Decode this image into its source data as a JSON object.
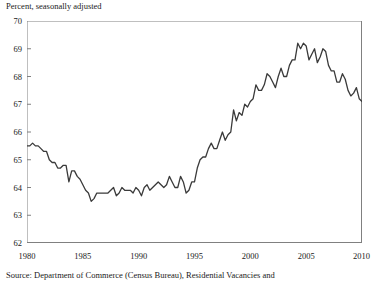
{
  "figure": {
    "subtitle": "Percent, seasonally adjusted",
    "source": "Source:  Department of Commerce (Census Bureau), Residential Vacancies and"
  },
  "colors": {
    "line": "#3a3a3a",
    "axis": "#808080",
    "text": "#1a1a1a",
    "background": "#ffffff"
  },
  "chart_data": {
    "type": "line",
    "title": "",
    "subtitle": "Percent, seasonally adjusted",
    "xlabel": "",
    "ylabel": "",
    "ylim": [
      62,
      70
    ],
    "xlim": [
      1980,
      2010
    ],
    "ytick_labels": [
      "62",
      "63",
      "64",
      "65",
      "66",
      "67",
      "68",
      "69",
      "70"
    ],
    "yticks": [
      62,
      63,
      64,
      65,
      66,
      67,
      68,
      69,
      70
    ],
    "xtick_labels": [
      "1980",
      "1985",
      "1990",
      "1995",
      "2000",
      "2005",
      "2010"
    ],
    "xticks": [
      1980,
      1985,
      1990,
      1995,
      2000,
      2005,
      2010
    ],
    "grid": false,
    "legend": false,
    "series": [
      {
        "name": "Homeownership rate",
        "x": [
          1980.0,
          1980.25,
          1980.5,
          1980.75,
          1981.0,
          1981.25,
          1981.5,
          1981.75,
          1982.0,
          1982.25,
          1982.5,
          1982.75,
          1983.0,
          1983.25,
          1983.5,
          1983.75,
          1984.0,
          1984.25,
          1984.5,
          1984.75,
          1985.0,
          1985.25,
          1985.5,
          1985.75,
          1986.0,
          1986.25,
          1986.5,
          1986.75,
          1987.0,
          1987.25,
          1987.5,
          1987.75,
          1988.0,
          1988.25,
          1988.5,
          1988.75,
          1989.0,
          1989.25,
          1989.5,
          1989.75,
          1990.0,
          1990.25,
          1990.5,
          1990.75,
          1991.0,
          1991.25,
          1991.5,
          1991.75,
          1992.0,
          1992.25,
          1992.5,
          1992.75,
          1993.0,
          1993.25,
          1993.5,
          1993.75,
          1994.0,
          1994.25,
          1994.5,
          1994.75,
          1995.0,
          1995.25,
          1995.5,
          1995.75,
          1996.0,
          1996.25,
          1996.5,
          1996.75,
          1997.0,
          1997.25,
          1997.5,
          1997.75,
          1998.0,
          1998.25,
          1998.5,
          1998.75,
          1999.0,
          1999.25,
          1999.5,
          1999.75,
          2000.0,
          2000.25,
          2000.5,
          2000.75,
          2001.0,
          2001.25,
          2001.5,
          2001.75,
          2002.0,
          2002.25,
          2002.5,
          2002.75,
          2003.0,
          2003.25,
          2003.5,
          2003.75,
          2004.0,
          2004.25,
          2004.5,
          2004.75,
          2005.0,
          2005.25,
          2005.5,
          2005.75,
          2006.0,
          2006.25,
          2006.5,
          2006.75,
          2007.0,
          2007.25,
          2007.5,
          2007.75,
          2008.0,
          2008.25,
          2008.5,
          2008.75,
          2009.0,
          2009.25,
          2009.5,
          2009.75,
          2010.0
        ],
        "values": [
          65.5,
          65.5,
          65.6,
          65.5,
          65.5,
          65.4,
          65.3,
          65.3,
          65.0,
          64.9,
          64.9,
          64.7,
          64.7,
          64.8,
          64.8,
          64.2,
          64.6,
          64.6,
          64.4,
          64.3,
          64.1,
          63.9,
          63.8,
          63.5,
          63.6,
          63.8,
          63.8,
          63.8,
          63.8,
          63.8,
          63.9,
          64.0,
          63.7,
          63.8,
          64.0,
          63.9,
          63.9,
          63.9,
          63.8,
          64.0,
          63.9,
          63.7,
          64.0,
          64.1,
          63.9,
          64.0,
          64.1,
          64.2,
          64.1,
          64.0,
          64.1,
          64.4,
          64.2,
          64.0,
          64.0,
          64.4,
          64.2,
          63.8,
          63.9,
          64.2,
          64.2,
          64.7,
          65.0,
          65.1,
          65.1,
          65.4,
          65.6,
          65.4,
          65.4,
          65.7,
          66.0,
          65.7,
          65.9,
          66.0,
          66.8,
          66.4,
          66.7,
          66.6,
          67.0,
          66.9,
          67.1,
          67.2,
          67.7,
          67.5,
          67.5,
          67.7,
          68.1,
          68.0,
          67.8,
          67.6,
          68.0,
          68.3,
          68.0,
          68.0,
          68.4,
          68.6,
          68.6,
          69.2,
          69.0,
          69.2,
          69.1,
          68.6,
          68.8,
          69.0,
          68.5,
          68.7,
          69.0,
          68.9,
          68.4,
          68.2,
          68.2,
          67.8,
          67.8,
          68.1,
          67.9,
          67.5,
          67.3,
          67.4,
          67.6,
          67.2,
          67.1
        ]
      }
    ],
    "annotations": [
      "Series peaks near 69.2 percent around 2004.",
      "Series troughs near 63.5 percent around 1985-1986."
    ]
  }
}
